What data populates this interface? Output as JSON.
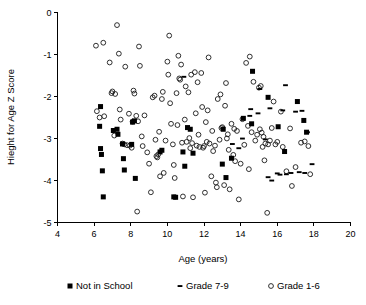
{
  "chart_data": {
    "type": "scatter",
    "title": "",
    "xlabel": "Age (years)",
    "ylabel": "Hieght for Age Z Score",
    "xlim": [
      4,
      20
    ],
    "ylim": [
      -5,
      0
    ],
    "xticks": [
      4,
      6,
      8,
      10,
      12,
      14,
      16,
      18,
      20
    ],
    "yticks": [
      0,
      -1,
      -2,
      -3,
      -4,
      -5
    ],
    "xtick_labels": [
      "4",
      "6",
      "8",
      "10",
      "12",
      "14",
      "16",
      "18",
      "20"
    ],
    "ytick_labels": [
      "0",
      "-1",
      "-2",
      "-3",
      "-4",
      "-5"
    ],
    "grid": false,
    "legend_position": "bottom",
    "series": [
      {
        "name": "Not in School",
        "marker": "filled-square",
        "color": "#000000",
        "points": [
          [
            6.35,
            -2.24
          ],
          [
            6.3,
            -2.71
          ],
          [
            6.35,
            -3.24
          ],
          [
            6.4,
            -3.38
          ],
          [
            6.45,
            -3.77
          ],
          [
            6.5,
            -4.39
          ],
          [
            7.05,
            -2.81
          ],
          [
            7.25,
            -2.78
          ],
          [
            7.3,
            -2.9
          ],
          [
            7.55,
            -3.13
          ],
          [
            7.6,
            -3.48
          ],
          [
            7.65,
            -3.75
          ],
          [
            8.05,
            -3.14
          ],
          [
            8.1,
            -2.61
          ],
          [
            8.2,
            -2.58
          ],
          [
            8.25,
            -3.95
          ],
          [
            9.6,
            -3.32
          ],
          [
            9.7,
            -3.28
          ],
          [
            10.35,
            -4.39
          ],
          [
            10.45,
            -4.4
          ],
          [
            10.85,
            -3.32
          ],
          [
            10.95,
            -3.66
          ],
          [
            11.1,
            -2.74
          ],
          [
            11.25,
            -2.78
          ],
          [
            11.4,
            -3.35
          ],
          [
            13.0,
            -3.61
          ],
          [
            13.05,
            -2.78
          ],
          [
            13.2,
            -3.93
          ],
          [
            13.5,
            -3.47
          ],
          [
            14.15,
            -2.52
          ],
          [
            14.6,
            -2.65
          ],
          [
            14.65,
            -1.4
          ],
          [
            15.5,
            -2.02
          ],
          [
            16.05,
            -2.72
          ],
          [
            16.4,
            -3.31
          ],
          [
            17.1,
            -2.12
          ],
          [
            17.45,
            -2.57
          ],
          [
            17.6,
            -2.85
          ]
        ]
      },
      {
        "name": "Grade 7-9",
        "marker": "dash",
        "color": "#000000",
        "points": [
          [
            10.9,
            -1.53
          ],
          [
            13.55,
            -3.13
          ],
          [
            13.9,
            -3.23
          ],
          [
            14.1,
            -3.0
          ],
          [
            14.5,
            -2.46
          ],
          [
            14.55,
            -2.3
          ],
          [
            14.95,
            -2.4
          ],
          [
            15.05,
            -1.82
          ],
          [
            15.35,
            -3.02
          ],
          [
            15.5,
            -3.92
          ],
          [
            15.6,
            -2.28
          ],
          [
            15.7,
            -4.0
          ],
          [
            16.0,
            -3.83
          ],
          [
            16.15,
            -3.86
          ],
          [
            16.3,
            -2.33
          ],
          [
            16.45,
            -1.73
          ],
          [
            16.5,
            -3.85
          ],
          [
            16.75,
            -3.82
          ],
          [
            17.0,
            -2.36
          ],
          [
            17.2,
            -3.8
          ],
          [
            17.35,
            -2.34
          ],
          [
            17.5,
            -3.82
          ],
          [
            17.65,
            -2.85
          ],
          [
            17.9,
            -3.61
          ]
        ]
      },
      {
        "name": "Grade 1-6",
        "marker": "open-circle",
        "color": "#1a1a1a",
        "points": [
          [
            6.1,
            -0.79
          ],
          [
            6.15,
            -2.35
          ],
          [
            6.5,
            -0.72
          ],
          [
            6.55,
            -2.47
          ],
          [
            6.85,
            -1.19
          ],
          [
            6.95,
            -1.92
          ],
          [
            7.0,
            -1.88
          ],
          [
            7.1,
            -2.93
          ],
          [
            7.15,
            -1.94
          ],
          [
            7.25,
            -0.3
          ],
          [
            7.35,
            -0.98
          ],
          [
            7.4,
            -2.31
          ],
          [
            7.45,
            -2.55
          ],
          [
            7.55,
            -3.12
          ],
          [
            7.65,
            -3.14
          ],
          [
            7.7,
            -1.29
          ],
          [
            7.8,
            -3.16
          ],
          [
            7.9,
            -2.41
          ],
          [
            7.95,
            -3.17
          ],
          [
            8.05,
            -3.22
          ],
          [
            8.15,
            -1.86
          ],
          [
            8.2,
            -1.93
          ],
          [
            8.3,
            -2.46
          ],
          [
            8.35,
            -4.74
          ],
          [
            8.4,
            -2.59
          ],
          [
            8.45,
            -0.81
          ],
          [
            8.5,
            -1.27
          ],
          [
            8.6,
            -2.95
          ],
          [
            8.65,
            -3.18
          ],
          [
            8.75,
            -2.45
          ],
          [
            8.9,
            -3.33
          ],
          [
            9.0,
            -3.6
          ],
          [
            9.1,
            -4.28
          ],
          [
            9.2,
            -2.02
          ],
          [
            9.3,
            -1.98
          ],
          [
            9.35,
            -3.03
          ],
          [
            9.4,
            -3.42
          ],
          [
            9.45,
            -3.45
          ],
          [
            9.5,
            -3.38
          ],
          [
            9.55,
            -2.84
          ],
          [
            9.6,
            -3.9
          ],
          [
            9.7,
            -2.06
          ],
          [
            9.75,
            -1.89
          ],
          [
            9.8,
            -3.82
          ],
          [
            9.9,
            -3.05
          ],
          [
            10.0,
            -1.17
          ],
          [
            10.05,
            -1.48
          ],
          [
            10.1,
            -0.55
          ],
          [
            10.15,
            -2.16
          ],
          [
            10.2,
            -2.65
          ],
          [
            10.3,
            -3.14
          ],
          [
            10.35,
            -3.63
          ],
          [
            10.4,
            -3.94
          ],
          [
            10.5,
            -1.92
          ],
          [
            10.55,
            -2.68
          ],
          [
            10.6,
            -1.03
          ],
          [
            10.65,
            -1.57
          ],
          [
            10.7,
            -1.6
          ],
          [
            10.75,
            -1.24
          ],
          [
            10.8,
            -3.1
          ],
          [
            10.85,
            -4.38
          ],
          [
            10.95,
            -2.55
          ],
          [
            11.0,
            -1.76
          ],
          [
            11.05,
            -3.08
          ],
          [
            11.15,
            -1.9
          ],
          [
            11.2,
            -2.99
          ],
          [
            11.25,
            -3.23
          ],
          [
            11.3,
            -1.48
          ],
          [
            11.35,
            -3.11
          ],
          [
            11.4,
            -4.4
          ],
          [
            11.5,
            -1.42
          ],
          [
            11.55,
            -2.4
          ],
          [
            11.6,
            -3.17
          ],
          [
            11.65,
            -1.66
          ],
          [
            11.7,
            -2.91
          ],
          [
            11.75,
            -3.2
          ],
          [
            11.85,
            -1.44
          ],
          [
            11.9,
            -2.25
          ],
          [
            11.95,
            -3.22
          ],
          [
            12.0,
            -3.18
          ],
          [
            12.05,
            -4.29
          ],
          [
            12.1,
            -2.61
          ],
          [
            12.15,
            -3.08
          ],
          [
            12.2,
            -2.33
          ],
          [
            12.25,
            -1.07
          ],
          [
            12.3,
            -3.12
          ],
          [
            12.4,
            -3.9
          ],
          [
            12.45,
            -2.82
          ],
          [
            12.5,
            -3.3
          ],
          [
            12.6,
            -3.17
          ],
          [
            12.65,
            -4.05
          ],
          [
            12.7,
            -4.16
          ],
          [
            12.75,
            -2.06
          ],
          [
            12.85,
            -3.03
          ],
          [
            12.9,
            -1.95
          ],
          [
            12.95,
            -2.75
          ],
          [
            13.0,
            -2.73
          ],
          [
            13.1,
            -4.11
          ],
          [
            13.15,
            -2.22
          ],
          [
            13.2,
            -1.68
          ],
          [
            13.25,
            -3.0
          ],
          [
            13.3,
            -2.9
          ],
          [
            13.35,
            -3.27
          ],
          [
            13.4,
            -4.21
          ],
          [
            13.5,
            -2.65
          ],
          [
            13.6,
            -3.39
          ],
          [
            13.65,
            -2.77
          ],
          [
            13.7,
            -3.54
          ],
          [
            13.8,
            -2.82
          ],
          [
            13.9,
            -4.45
          ],
          [
            14.0,
            -3.6
          ],
          [
            14.1,
            -2.54
          ],
          [
            14.2,
            -3.15
          ],
          [
            14.3,
            -1.2
          ],
          [
            14.4,
            -2.7
          ],
          [
            14.45,
            -3.73
          ],
          [
            14.5,
            -1.05
          ],
          [
            14.6,
            -2.85
          ],
          [
            14.7,
            -1.65
          ],
          [
            14.8,
            -3.05
          ],
          [
            14.9,
            -2.91
          ],
          [
            15.0,
            -1.79
          ],
          [
            15.05,
            -2.78
          ],
          [
            15.1,
            -1.75
          ],
          [
            15.15,
            -2.86
          ],
          [
            15.2,
            -3.2
          ],
          [
            15.25,
            -2.96
          ],
          [
            15.3,
            -3.52
          ],
          [
            15.35,
            -3.12
          ],
          [
            15.45,
            -4.77
          ],
          [
            15.5,
            -3.14
          ],
          [
            15.6,
            -3.05
          ],
          [
            15.7,
            -2.75
          ],
          [
            15.8,
            -2.12
          ],
          [
            15.9,
            -3.14
          ],
          [
            16.0,
            -3.08
          ],
          [
            16.2,
            -2.36
          ],
          [
            16.3,
            -3.2
          ],
          [
            16.5,
            -3.78
          ],
          [
            16.7,
            -2.76
          ],
          [
            16.8,
            -4.13
          ],
          [
            17.0,
            -3.68
          ],
          [
            17.3,
            -3.1
          ],
          [
            17.5,
            -3.07
          ],
          [
            17.7,
            -3.18
          ],
          [
            17.8,
            -3.85
          ],
          [
            6.3,
            -2.5
          ],
          [
            8.1,
            -2.6
          ]
        ]
      }
    ]
  },
  "legend": {
    "items": [
      {
        "label": "Not in School",
        "marker": "filled-square"
      },
      {
        "label": "Grade 7-9",
        "marker": "dash"
      },
      {
        "label": "Grade 1-6",
        "marker": "open-circle"
      }
    ]
  }
}
